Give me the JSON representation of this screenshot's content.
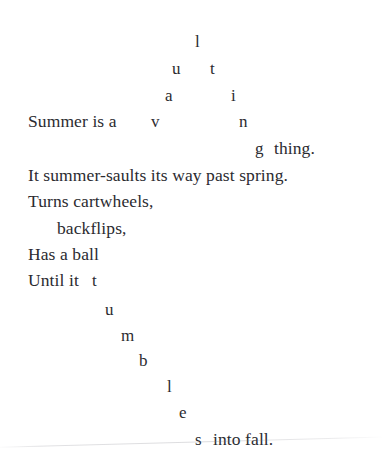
{
  "document": {
    "kind": "concrete-poem",
    "title": "Summer is a vaulting thing",
    "background_color": "#ffffff",
    "text_color": "#2b2b30"
  },
  "arc_word": {
    "word": "vaulting",
    "letters": [
      {
        "char": "l",
        "x": 195,
        "y": 33
      },
      {
        "char": "u",
        "x": 172,
        "y": 60
      },
      {
        "char": "t",
        "x": 210,
        "y": 60
      },
      {
        "char": "a",
        "x": 165,
        "y": 87
      },
      {
        "char": "i",
        "x": 231,
        "y": 87
      },
      {
        "char": "v",
        "x": 151,
        "y": 113
      },
      {
        "char": "n",
        "x": 239,
        "y": 113
      },
      {
        "char": "g",
        "x": 255,
        "y": 140
      }
    ]
  },
  "cascade_word": {
    "word": "tumbles",
    "letters": [
      {
        "char": "t",
        "x": 92,
        "y": 272
      },
      {
        "char": "u",
        "x": 105,
        "y": 301
      },
      {
        "char": "m",
        "x": 121,
        "y": 327
      },
      {
        "char": "b",
        "x": 139,
        "y": 352
      },
      {
        "char": "l",
        "x": 167,
        "y": 378
      },
      {
        "char": "e",
        "x": 179,
        "y": 404
      },
      {
        "char": "s",
        "x": 195,
        "y": 431
      }
    ]
  },
  "lines": [
    {
      "text": "Summer is a",
      "x": 28,
      "y": 113
    },
    {
      "text": "thing.",
      "x": 274,
      "y": 140
    },
    {
      "text": "It summer-saults its way past spring.",
      "x": 28,
      "y": 167
    },
    {
      "text": "Turns cartwheels,",
      "x": 28,
      "y": 193
    },
    {
      "text": "backflips,",
      "x": 57,
      "y": 220
    },
    {
      "text": "Has a ball",
      "x": 28,
      "y": 246
    },
    {
      "text": "Until it",
      "x": 28,
      "y": 272
    },
    {
      "text": "into fall.",
      "x": 213,
      "y": 431
    }
  ]
}
